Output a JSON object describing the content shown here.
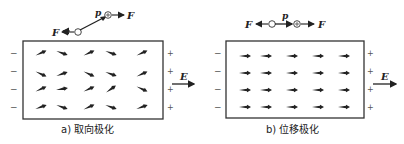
{
  "panels": [
    {
      "id": "a",
      "caption": "a) 取向极化",
      "dipole_label": "p",
      "force_label": "F",
      "field_label": "E",
      "minus_sign": "−",
      "plus_sign": "+",
      "description": "orientation polarization: dipoles partially aligned with field",
      "dipole_angles_deg": [
        [
          -25,
          20,
          -25,
          20,
          -25
        ],
        [
          25,
          -20,
          25,
          20,
          -25
        ],
        [
          -25,
          -10,
          -25,
          -35,
          25
        ],
        [
          -20,
          20,
          -25,
          20,
          -20
        ]
      ]
    },
    {
      "id": "b",
      "caption": "b) 位移极化",
      "dipole_label": "p",
      "force_label": "F",
      "field_label": "E",
      "minus_sign": "−",
      "plus_sign": "+",
      "description": "displacement polarization: all dipoles aligned with field",
      "dipole_angles_deg": [
        [
          0,
          0,
          0,
          0,
          0
        ],
        [
          0,
          0,
          0,
          0,
          0
        ],
        [
          0,
          0,
          0,
          0,
          0
        ],
        [
          0,
          0,
          0,
          0,
          0
        ]
      ]
    }
  ]
}
